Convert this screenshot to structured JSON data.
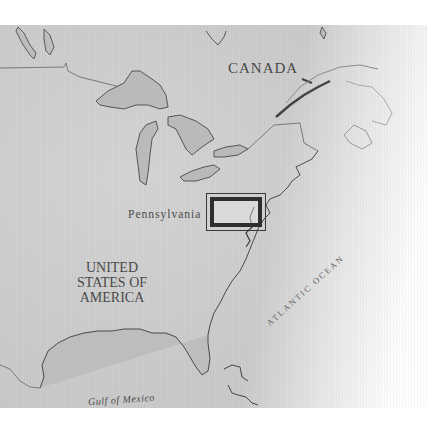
{
  "map": {
    "labels": {
      "canada": "CANADA",
      "pennsylvania": "Pennsylvania",
      "usa_line1": "UNITED",
      "usa_line2": "STATES OF",
      "usa_line3": "AMERICA",
      "gulf": "Gulf of Mexico",
      "atlantic": "ATLANTIC OCEAN"
    },
    "locator_box": {
      "region": "Pennsylvania / New Jersey area"
    },
    "colors": {
      "land": "#cccccc",
      "water": "#b8b8b8",
      "coastline": "#555555",
      "border": "#7a7a7a",
      "locator": "#2e2e2e",
      "text": "#4a4a4a"
    }
  }
}
